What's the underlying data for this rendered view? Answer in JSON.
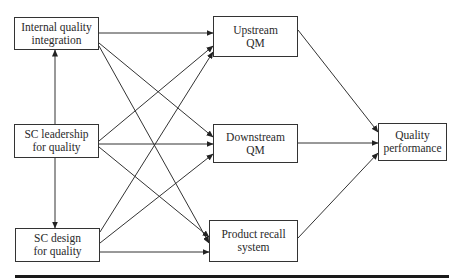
{
  "diagram": {
    "nodes": [
      {
        "id": "internal",
        "line1": "Internal quality",
        "line2": "integration",
        "box": [
          14,
          17,
          85,
          33
        ]
      },
      {
        "id": "leadership",
        "line1": "SC leadership",
        "line2": "for quality",
        "box": [
          14,
          124,
          85,
          34
        ]
      },
      {
        "id": "design",
        "line1": "SC design",
        "line2": "for quality",
        "box": [
          15,
          228,
          85,
          34
        ]
      },
      {
        "id": "upstream",
        "line1": "Upstream",
        "line2": "QM",
        "box": [
          213,
          16,
          85,
          41
        ]
      },
      {
        "id": "downstream",
        "line1": "Downstream",
        "line2": "QM",
        "box": [
          213,
          124,
          85,
          39
        ]
      },
      {
        "id": "recall",
        "line1": "Product recall",
        "line2": "system",
        "box": [
          209,
          220,
          89,
          42
        ]
      },
      {
        "id": "performance",
        "line1": "Quality",
        "line2": "performance",
        "box": [
          378,
          123,
          69,
          38
        ]
      }
    ],
    "edges": [
      {
        "from": "internal",
        "to": "upstream"
      },
      {
        "from": "internal",
        "to": "downstream"
      },
      {
        "from": "internal",
        "to": "recall"
      },
      {
        "from": "leadership",
        "to": "internal"
      },
      {
        "from": "leadership",
        "to": "design"
      },
      {
        "from": "leadership",
        "to": "upstream"
      },
      {
        "from": "leadership",
        "to": "downstream"
      },
      {
        "from": "leadership",
        "to": "recall"
      },
      {
        "from": "design",
        "to": "upstream"
      },
      {
        "from": "design",
        "to": "downstream"
      },
      {
        "from": "design",
        "to": "recall"
      },
      {
        "from": "upstream",
        "to": "performance"
      },
      {
        "from": "downstream",
        "to": "performance"
      },
      {
        "from": "recall",
        "to": "performance"
      }
    ]
  }
}
